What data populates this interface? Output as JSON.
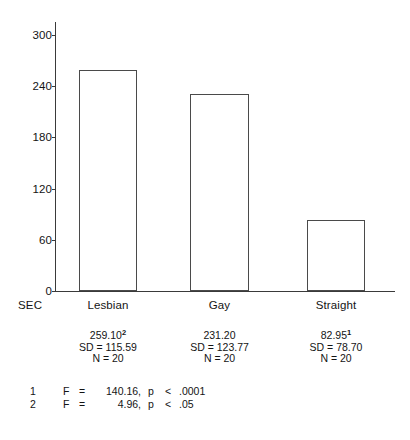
{
  "chart_data": {
    "type": "bar",
    "title": "",
    "subtitle": "",
    "xlabel": "",
    "ylabel": "",
    "row_key": "SEC",
    "categories": [
      "Lesbian",
      "Gay",
      "Straight"
    ],
    "values": [
      259.1,
      231.2,
      82.95
    ],
    "ylim": [
      0,
      315
    ],
    "yticks": [
      0,
      60,
      120,
      180,
      240,
      300
    ],
    "ytick_labels": [
      "0",
      "60",
      "120",
      "180",
      "240",
      "300"
    ],
    "grid": false,
    "legend": "none",
    "bar_fill": "#ffffff",
    "bar_edge": "#4a4a4a",
    "axis_color": "#3a3a3a",
    "series": [
      {
        "name": "SEC",
        "values": [
          259.1,
          231.2,
          82.95
        ],
        "labels": [
          "259.10",
          "231.20",
          "82.95"
        ],
        "footnote_markers": [
          "2",
          "",
          "1"
        ],
        "sd": [
          115.59,
          123.77,
          78.7
        ],
        "sd_labels": [
          "SD = 115.59",
          "SD = 123.77",
          "SD = 78.70"
        ],
        "n": [
          20,
          20,
          20
        ],
        "n_labels": [
          "N = 20",
          "N = 20",
          "N = 20"
        ]
      }
    ],
    "annotations": [
      {
        "marker": "1",
        "stat": "F",
        "eq": "=",
        "value": "140.16,",
        "p": "p",
        "lt": "<",
        "pvalue": ".0001"
      },
      {
        "marker": "2",
        "stat": "F",
        "eq": "=",
        "value": "4.96,",
        "p": "p",
        "lt": "<",
        "pvalue": ".05"
      }
    ]
  }
}
